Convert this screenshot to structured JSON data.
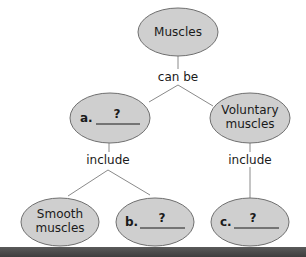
{
  "diagram": {
    "type": "concept-map",
    "colors": {
      "node_fill": "#cfcfcf",
      "node_stroke": "#6f6f6f",
      "line": "#8a8a8a",
      "bar": "#4a4a4a"
    },
    "nodes": {
      "root": {
        "label": "Muscles"
      },
      "a": {
        "prefix": "a.",
        "blank": "?"
      },
      "voluntary": {
        "line1": "Voluntary",
        "line2": "muscles"
      },
      "smooth": {
        "line1": "Smooth",
        "line2": "muscles"
      },
      "b": {
        "prefix": "b.",
        "blank": "?"
      },
      "c": {
        "prefix": "c.",
        "blank": "?"
      }
    },
    "links": {
      "can_be": "can be",
      "include_left": "include",
      "include_right": "include"
    }
  }
}
